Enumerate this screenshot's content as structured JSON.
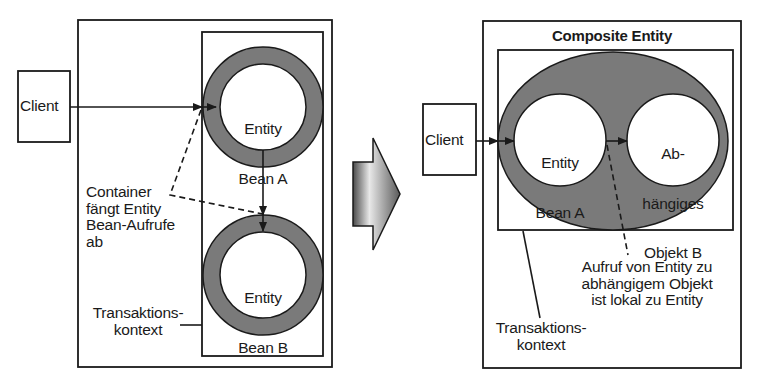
{
  "colors": {
    "ring_fill": "#7a7a7a",
    "line": "#1a1a1a",
    "background": "#ffffff",
    "arrow_light": "#e6e6e6",
    "arrow_dark": "#555555"
  },
  "left_panel": {
    "client_label": "Client",
    "bean_a": {
      "line1": "Entity",
      "line2": "Bean A"
    },
    "bean_b": {
      "line1": "Entity",
      "line2": "Bean B"
    },
    "container_note": "Container\nfängt Entity\nBean-Aufrufe\nab",
    "transaction_label": "Transaktions-\nkontext"
  },
  "transition_arrow": {
    "icon": "right-block-arrow-icon"
  },
  "right_panel": {
    "title": "Composite Entity",
    "client_label": "Client",
    "bean_a": {
      "line1": "Entity",
      "line2": "Bean A"
    },
    "dependent_object": {
      "line1": "Ab-",
      "line2": "hängiges",
      "line3": "Objekt B"
    },
    "call_note": "Aufruf von Entity zu\nabhängigem Objekt\nist lokal zu Entity",
    "transaction_label": "Transaktions-\nkontext"
  }
}
